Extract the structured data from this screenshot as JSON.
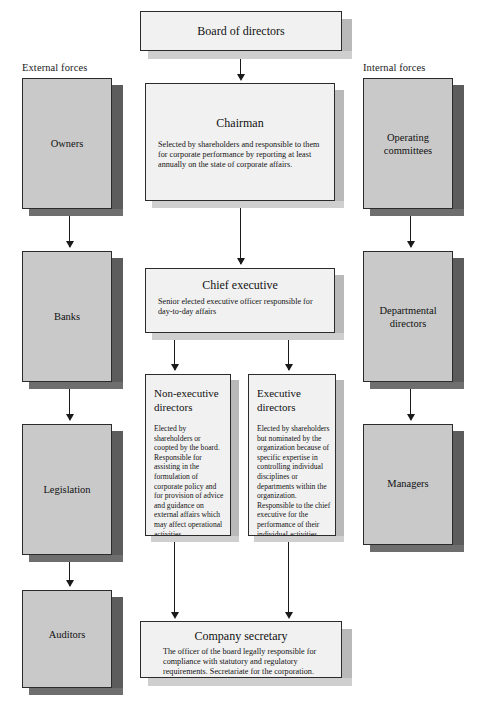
{
  "diagram": {
    "columns": {
      "external_header": "External forces",
      "internal_header": "Internal forces"
    },
    "colors": {
      "outer_box_fill": "#c9c9c9",
      "outer_box_shadow": "#5c5c5c",
      "center_box_fill": "#f1f1f1",
      "center_box_shadow": "#b9b9b9",
      "outline": "#2b2b2b",
      "connector": "#1a1a1a",
      "page_background": "#ffffff"
    },
    "external_forces": [
      {
        "label": "Owners"
      },
      {
        "label": "Banks"
      },
      {
        "label": "Legislation"
      },
      {
        "label": "Auditors"
      }
    ],
    "internal_forces": [
      {
        "label_line1": "Operating",
        "label_line2": "committees"
      },
      {
        "label_line1": "Departmental",
        "label_line2": "directors"
      },
      {
        "label_line1": "Managers",
        "label_line2": ""
      }
    ],
    "center": {
      "board": {
        "title": "Board of directors"
      },
      "chairman": {
        "title": "Chairman",
        "body": "Selected by shareholders and responsible to them for corporate performance by reporting at least annually on the state of corporate affairs."
      },
      "chief_executive": {
        "title": "Chief executive",
        "body": "Senior elected executive officer responsible for day-to-day affairs"
      },
      "non_executive_directors": {
        "title_line1": "Non-executive",
        "title_line2": "directors",
        "body": "Elected by shareholders or coopted by the board. Responsible for assisting in the formulation of corporate policy and for provision of advice and guidance on external affairs which may affect operational activities."
      },
      "executive_directors": {
        "title_line1": "Executive",
        "title_line2": "directors",
        "body": "Elected by shareholders but nominated by the organization because of specific expertise in controlling individual disciplines or departments within the organization. Responsible to the chief executive for the performance of their individual activities."
      },
      "company_secretary": {
        "title": "Company secretary",
        "body": "The officer of the board legally responsible for compliance with statutory and regulatory requirements. Secretariate for the corporation."
      }
    }
  }
}
